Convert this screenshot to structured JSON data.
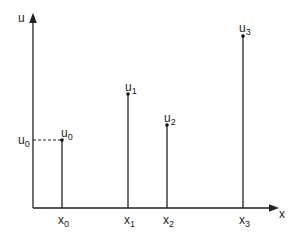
{
  "diagram": {
    "type": "impulse-plot",
    "axes": {
      "y_label": "u",
      "x_label": "x"
    },
    "reference_level": {
      "label": "u",
      "subscript": "0",
      "dashed": true
    },
    "samples": [
      {
        "x_label": "x",
        "x_sub": "0",
        "u_label": "u",
        "u_sub": "0"
      },
      {
        "x_label": "x",
        "x_sub": "1",
        "u_label": "u",
        "u_sub": "1"
      },
      {
        "x_label": "x",
        "x_sub": "2",
        "u_label": "u",
        "u_sub": "2"
      },
      {
        "x_label": "x",
        "x_sub": "3",
        "u_label": "u",
        "u_sub": "3"
      }
    ]
  }
}
